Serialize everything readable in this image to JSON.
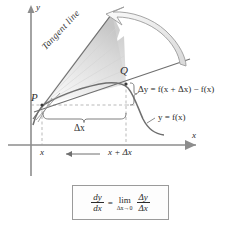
{
  "figure": {
    "axes": {
      "y_axis_label": "y",
      "x_axis_label": "x",
      "x_tick_left": "x",
      "x_tick_right": "x + Δx"
    },
    "points": {
      "P": "P",
      "Q": "Q"
    },
    "annotations": {
      "tangent_line": "Tangent line",
      "delta_x": "Δx",
      "delta_y": "Δy = f(x + Δx) − f(x)",
      "curve_label": "y = f(x)"
    },
    "formula": {
      "lhs_num": "dy",
      "lhs_den": "dx",
      "equals": "=",
      "limit": "lim",
      "limit_subscript": "Δx→0",
      "rhs_num": "Δy",
      "rhs_den": "Δx"
    },
    "colors": {
      "ink": "#2b2b2b",
      "axis": "#8d8d8d",
      "curve": "#6f6f6f",
      "fan_light": "#f2f2f2",
      "fan_dark": "#c9c9c9",
      "arrow_outline": "#9b9b9b"
    }
  }
}
